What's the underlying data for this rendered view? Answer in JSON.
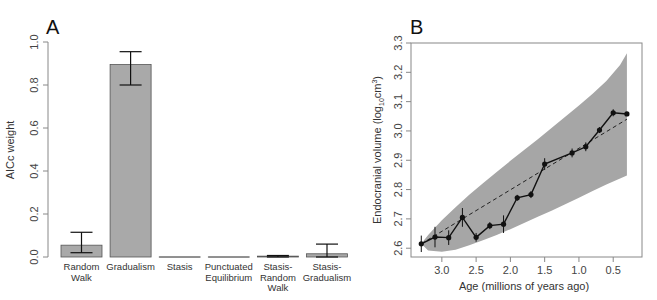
{
  "chart_data": [
    {
      "panel": "A",
      "type": "bar",
      "title": "",
      "xlabel": "",
      "ylabel": "AICc weight",
      "ylim": [
        0,
        1
      ],
      "yticks": [
        "0.0",
        "0.2",
        "0.4",
        "0.6",
        "0.8",
        "1.0"
      ],
      "categories": [
        [
          "Random",
          "Walk"
        ],
        [
          "Gradualism"
        ],
        [
          "Stasis"
        ],
        [
          "Punctuated",
          "Equilibrium"
        ],
        [
          "Stasis-",
          "Random",
          "Walk"
        ],
        [
          "Stasis-",
          "Gradualism"
        ]
      ],
      "values": [
        0.055,
        0.895,
        0.0,
        0.0,
        0.004,
        0.015
      ],
      "error_low": [
        0.02,
        0.8,
        0.0,
        0.0,
        0.0,
        0.0
      ],
      "error_high": [
        0.115,
        0.955,
        0.0,
        0.0,
        0.007,
        0.06
      ],
      "bar_color": "#a9a9a9",
      "grid": false
    },
    {
      "panel": "B",
      "type": "line",
      "title": "",
      "xlabel": "Age (millions of years ago)",
      "ylabel_main": "Endocranial volume (log",
      "ylabel_sub": "10",
      "ylabel_unit": "cm",
      "ylabel_sup": "3",
      "ylabel_close": ")",
      "xlim": [
        3.45,
        0.08
      ],
      "ylim": [
        2.57,
        3.3
      ],
      "xticks": [
        "3.0",
        "2.5",
        "2.0",
        "1.5",
        "1.0",
        "0.5"
      ],
      "xtick_values": [
        3.0,
        2.5,
        2.0,
        1.5,
        1.0,
        0.5
      ],
      "yticks": [
        "2.6",
        "2.7",
        "2.8",
        "2.9",
        "3.0",
        "3.1",
        "3.2",
        "3.3"
      ],
      "ytick_values": [
        2.6,
        2.7,
        2.8,
        2.9,
        3.0,
        3.1,
        3.2,
        3.3
      ],
      "series": [
        {
          "name": "observed means",
          "style": "solid-with-points",
          "x": [
            3.3,
            3.1,
            2.9,
            2.7,
            2.5,
            2.3,
            2.1,
            1.9,
            1.7,
            1.5,
            1.1,
            0.9,
            0.7,
            0.5,
            0.3
          ],
          "y": [
            2.615,
            2.638,
            2.636,
            2.705,
            2.637,
            2.677,
            2.682,
            2.772,
            2.783,
            2.887,
            2.925,
            2.946,
            3.003,
            3.062,
            3.058
          ],
          "err": [
            0.028,
            0.035,
            0.025,
            0.032,
            0.015,
            0.012,
            0.03,
            0.01,
            0.012,
            0.02,
            0.015,
            0.015,
            0.01,
            0.012,
            0.0
          ]
        },
        {
          "name": "gradualism expectation",
          "style": "dashed",
          "x": [
            3.3,
            0.3
          ],
          "y": [
            2.615,
            3.04
          ]
        }
      ],
      "envelope": {
        "name": "95% probability envelope",
        "color": "#a6a6a6",
        "x": [
          3.3,
          3.2,
          3.0,
          2.8,
          2.6,
          2.4,
          2.2,
          2.0,
          1.8,
          1.6,
          1.4,
          1.2,
          1.0,
          0.8,
          0.6,
          0.4,
          0.3
        ],
        "upper": [
          2.615,
          2.645,
          2.695,
          2.74,
          2.782,
          2.822,
          2.86,
          2.898,
          2.935,
          2.972,
          3.01,
          3.048,
          3.087,
          3.127,
          3.17,
          3.225,
          3.265
        ],
        "lower": [
          2.615,
          2.592,
          2.588,
          2.595,
          2.61,
          2.627,
          2.645,
          2.665,
          2.686,
          2.707,
          2.728,
          2.75,
          2.772,
          2.795,
          2.817,
          2.838,
          2.848
        ]
      },
      "grid": false
    }
  ],
  "panels": {
    "a_letter": "A",
    "b_letter": "B"
  }
}
